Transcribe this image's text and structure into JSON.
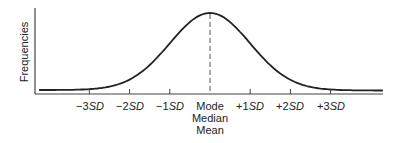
{
  "chart_data": {
    "type": "line",
    "title": "",
    "xlabel": "",
    "ylabel": "Frequencies",
    "grid": false,
    "legend": null,
    "categories": [
      "-3SD",
      "-2SD",
      "-1SD",
      "Mode/Median/Mean",
      "+1SD",
      "+2SD",
      "+3SD"
    ],
    "x": [
      -3,
      -2,
      -1,
      0,
      1,
      2,
      3
    ],
    "tick_labels": [
      {
        "prefix": "−3",
        "suffix": "SD"
      },
      {
        "prefix": "−2",
        "suffix": "SD"
      },
      {
        "prefix": "−1",
        "suffix": "SD"
      },
      {
        "lines": [
          "Mode",
          "Median",
          "Mean"
        ]
      },
      {
        "prefix": "+1",
        "suffix": "SD"
      },
      {
        "prefix": "+2",
        "suffix": "SD"
      },
      {
        "prefix": "+3",
        "suffix": "SD"
      }
    ],
    "series": [
      {
        "name": "normal curve",
        "values": [
          0.011,
          0.135,
          0.607,
          1.0,
          0.607,
          0.135,
          0.011
        ]
      }
    ],
    "annotations": [
      "dashed vertical line at mean (Mode = Median = Mean)"
    ],
    "xlim": [
      -4.25,
      4.3
    ],
    "ylim": [
      0,
      1.05
    ],
    "colors": {
      "curve": "#222222",
      "axis": "#444444",
      "dash": "#555555"
    }
  }
}
